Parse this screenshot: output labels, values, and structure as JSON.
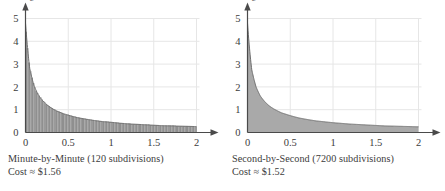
{
  "figure": {
    "background_color": "#ffffff",
    "text_color": "#3c3c3c",
    "grid_color": "#e6e6e6",
    "axis_color": "#4a4a4a",
    "fill_color": "#a9a9a9",
    "curve_color": "#6e6e6e"
  },
  "panels": [
    {
      "id": "minute-by-minute",
      "caption_line1": "Minute-by-Minute (120 subdivisions)",
      "caption_line2": "Cost ≈ $1.56",
      "chart_data": {
        "type": "area",
        "title": "Minute-by-Minute (120 subdivisions)",
        "subtitle": "Cost ≈ $1.56",
        "xlabel": "t",
        "ylabel": "c",
        "xlim": [
          0,
          2
        ],
        "ylim": [
          0,
          5
        ],
        "xticks": [
          0,
          0.5,
          1,
          1.5,
          2
        ],
        "xticklabels": [
          "0",
          "0.5",
          "1",
          "1.5",
          "2"
        ],
        "yticks": [
          0,
          1,
          2,
          3,
          4,
          5
        ],
        "yticklabels": [
          "0",
          "1",
          "2",
          "3",
          "4",
          "5"
        ],
        "grid": true,
        "legend": "none",
        "subdivisions": 120,
        "riemann_rectangles": true,
        "area_value": 1.56,
        "area_units": "$",
        "x": [
          0.0,
          0.05,
          0.1,
          0.15,
          0.2,
          0.25,
          0.3,
          0.35,
          0.4,
          0.45,
          0.5,
          0.6,
          0.7,
          0.8,
          0.9,
          1.0,
          1.1,
          1.2,
          1.3,
          1.4,
          1.5,
          1.6,
          1.7,
          1.8,
          1.9,
          2.0
        ],
        "y": [
          4.8,
          2.8,
          2.05,
          1.65,
          1.4,
          1.22,
          1.08,
          0.97,
          0.89,
          0.82,
          0.76,
          0.66,
          0.59,
          0.53,
          0.48,
          0.45,
          0.41,
          0.38,
          0.36,
          0.34,
          0.32,
          0.3,
          0.29,
          0.28,
          0.27,
          0.26
        ]
      }
    },
    {
      "id": "second-by-second",
      "caption_line1": "Second-by-Second (7200 subdivisions)",
      "caption_line2": "Cost ≈ $1.52",
      "chart_data": {
        "type": "area",
        "title": "Second-by-Second (7200 subdivisions)",
        "subtitle": "Cost ≈ $1.52",
        "xlabel": "t",
        "ylabel": "c",
        "xlim": [
          0,
          2
        ],
        "ylim": [
          0,
          5
        ],
        "xticks": [
          0,
          0.5,
          1,
          1.5,
          2
        ],
        "xticklabels": [
          "0",
          "0.5",
          "1",
          "1.5",
          "2"
        ],
        "yticks": [
          0,
          1,
          2,
          3,
          4,
          5
        ],
        "yticklabels": [
          "0",
          "1",
          "2",
          "3",
          "4",
          "5"
        ],
        "grid": true,
        "legend": "none",
        "subdivisions": 7200,
        "riemann_rectangles": false,
        "area_value": 1.52,
        "area_units": "$",
        "x": [
          0.0,
          0.05,
          0.1,
          0.15,
          0.2,
          0.25,
          0.3,
          0.35,
          0.4,
          0.45,
          0.5,
          0.6,
          0.7,
          0.8,
          0.9,
          1.0,
          1.1,
          1.2,
          1.3,
          1.4,
          1.5,
          1.6,
          1.7,
          1.8,
          1.9,
          2.0
        ],
        "y": [
          4.8,
          2.75,
          2.0,
          1.6,
          1.36,
          1.18,
          1.05,
          0.95,
          0.86,
          0.8,
          0.74,
          0.64,
          0.57,
          0.51,
          0.47,
          0.43,
          0.4,
          0.37,
          0.35,
          0.33,
          0.31,
          0.29,
          0.28,
          0.27,
          0.26,
          0.25
        ]
      }
    }
  ]
}
